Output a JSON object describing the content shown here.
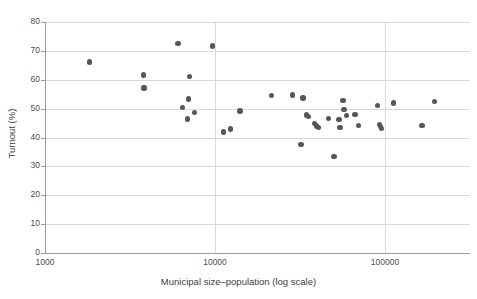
{
  "chart_data": {
    "type": "scatter",
    "title": "",
    "xlabel": "Municipal size–population (log scale)",
    "ylabel": "Turnout (%)",
    "x_scale": "log",
    "xlim": [
      1000,
      250000
    ],
    "ylim": [
      0,
      80
    ],
    "grid": "horizontal-and-vertical",
    "legend": "none",
    "x_ticks": [
      {
        "value": 1000,
        "label": "1000"
      },
      {
        "value": 10000,
        "label": "10000"
      },
      {
        "value": 100000,
        "label": "100000"
      }
    ],
    "y_ticks": [
      {
        "value": 0,
        "label": "0"
      },
      {
        "value": 10,
        "label": "10"
      },
      {
        "value": 20,
        "label": "20"
      },
      {
        "value": 30,
        "label": "30"
      },
      {
        "value": 40,
        "label": "40"
      },
      {
        "value": 50,
        "label": "50"
      },
      {
        "value": 60,
        "label": "60"
      },
      {
        "value": 70,
        "label": "70"
      },
      {
        "value": 80,
        "label": "80"
      }
    ],
    "marker": {
      "shape": "circle",
      "color": "#565656",
      "size_px": 5.4
    },
    "points": [
      {
        "x": 1820,
        "y": 66.2
      },
      {
        "x": 3800,
        "y": 61.6
      },
      {
        "x": 3820,
        "y": 57.2
      },
      {
        "x": 6050,
        "y": 72.6
      },
      {
        "x": 6450,
        "y": 50.4
      },
      {
        "x": 6900,
        "y": 46.4
      },
      {
        "x": 7100,
        "y": 61.1
      },
      {
        "x": 7000,
        "y": 53.4
      },
      {
        "x": 7600,
        "y": 48.6
      },
      {
        "x": 9700,
        "y": 71.7
      },
      {
        "x": 11200,
        "y": 41.9
      },
      {
        "x": 12300,
        "y": 43.0
      },
      {
        "x": 14000,
        "y": 49.2
      },
      {
        "x": 21500,
        "y": 54.6
      },
      {
        "x": 28500,
        "y": 54.7
      },
      {
        "x": 33000,
        "y": 53.7
      },
      {
        "x": 32000,
        "y": 37.5
      },
      {
        "x": 34500,
        "y": 47.8
      },
      {
        "x": 35500,
        "y": 47.2
      },
      {
        "x": 38500,
        "y": 44.8
      },
      {
        "x": 39500,
        "y": 44.0
      },
      {
        "x": 40500,
        "y": 43.4
      },
      {
        "x": 46500,
        "y": 46.5
      },
      {
        "x": 50000,
        "y": 33.4
      },
      {
        "x": 53500,
        "y": 46.3
      },
      {
        "x": 54500,
        "y": 43.5
      },
      {
        "x": 56500,
        "y": 52.9
      },
      {
        "x": 57500,
        "y": 49.8
      },
      {
        "x": 59500,
        "y": 47.6
      },
      {
        "x": 66500,
        "y": 48.0
      },
      {
        "x": 70000,
        "y": 44.2
      },
      {
        "x": 90000,
        "y": 51.1
      },
      {
        "x": 93000,
        "y": 44.4
      },
      {
        "x": 94000,
        "y": 43.9
      },
      {
        "x": 95000,
        "y": 43.2
      },
      {
        "x": 112000,
        "y": 51.9
      },
      {
        "x": 165000,
        "y": 44.1
      },
      {
        "x": 195000,
        "y": 52.4
      }
    ]
  },
  "axes": {
    "x_title": "Municipal size–population (log scale)",
    "y_title": "Turnout (%)"
  }
}
